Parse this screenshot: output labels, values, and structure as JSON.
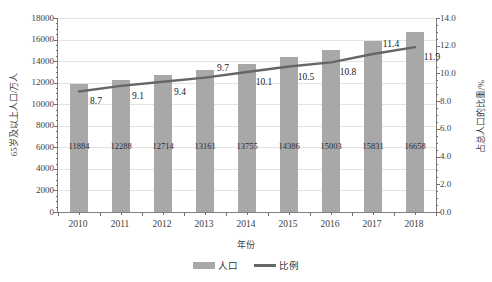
{
  "chart_data": {
    "type": "bar",
    "title": "",
    "subtitle": "",
    "xlabel": "年份",
    "ylabel": "65岁及以上人口/万人",
    "ylabel_secondary": "占总人口的比重/%",
    "categories": [
      "2010",
      "2011",
      "2012",
      "2013",
      "2014",
      "2015",
      "2016",
      "2017",
      "2018"
    ],
    "ylim": [
      0,
      18000
    ],
    "ytick_step": 2000,
    "yticks": [
      "18000",
      "16000",
      "14000",
      "12000",
      "10000",
      "8000",
      "6000",
      "4000",
      "2000",
      "0"
    ],
    "ylim_secondary": [
      0,
      14
    ],
    "ytick_step_secondary": 2,
    "yticks_secondary": [
      "14.0",
      "12.0",
      "10.0",
      "8.0",
      "6.0",
      "4.0",
      "2.0",
      "0.0"
    ],
    "grid": true,
    "legend_position": "bottom",
    "series": [
      {
        "name": "人口",
        "type": "bar",
        "axis": "left",
        "color": "#a8a8a8",
        "values": [
          11884,
          12288,
          12714,
          13161,
          13755,
          14386,
          15003,
          15831,
          16658
        ],
        "labels": [
          "11884",
          "12288",
          "12714",
          "13161",
          "13755",
          "14386",
          "15003",
          "15831",
          "16658"
        ]
      },
      {
        "name": "比例",
        "type": "line",
        "axis": "right",
        "color": "#666666",
        "values": [
          8.7,
          9.1,
          9.4,
          9.7,
          10.1,
          10.5,
          10.8,
          11.4,
          11.9
        ],
        "labels": [
          "8.7",
          "9.1",
          "9.4",
          "9.7",
          "10.1",
          "10.5",
          "10.8",
          "11.4",
          "11.9"
        ]
      }
    ]
  },
  "legend": {
    "items": [
      {
        "label": "人口",
        "marker": "bar-swatch"
      },
      {
        "label": "比例",
        "marker": "line-swatch"
      }
    ]
  }
}
